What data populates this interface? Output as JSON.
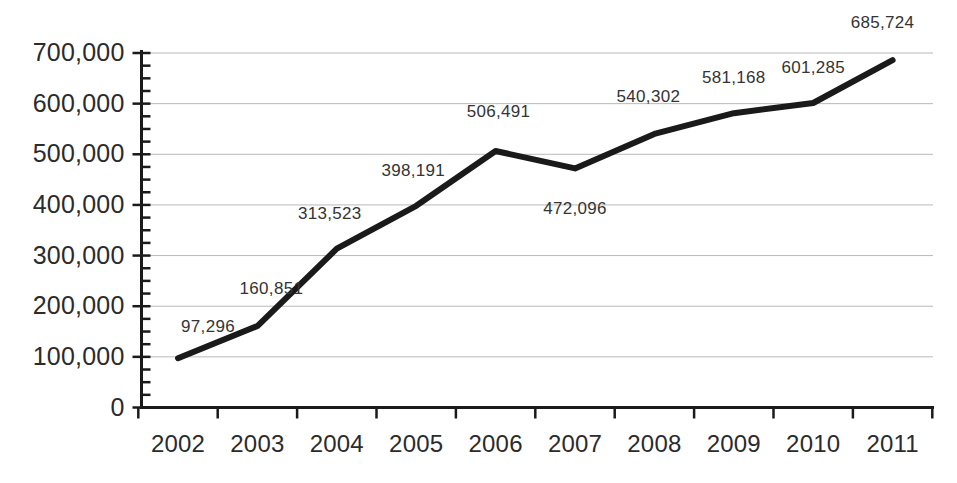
{
  "chart_data": {
    "type": "line",
    "title": "",
    "subtitle": "",
    "xlabel": "",
    "ylabel": "",
    "categories": [
      "2002",
      "2003",
      "2004",
      "2005",
      "2006",
      "2007",
      "2008",
      "2009",
      "2010",
      "2011"
    ],
    "values": [
      97296,
      160851,
      313523,
      398191,
      506491,
      472096,
      540302,
      581168,
      601285,
      685724
    ],
    "point_labels": [
      "97,296",
      "160,851",
      "313,523",
      "398,191",
      "506,491",
      "472,096",
      "540,302",
      "581,168",
      "601,285",
      "685,724"
    ],
    "ylim": [
      0,
      700000
    ],
    "ytick_labels": [
      "700,000",
      "600,000",
      "500,000",
      "400,000",
      "300,000",
      "200,000",
      "100,000",
      "0"
    ],
    "ytick_values": [
      700000,
      600000,
      500000,
      400000,
      300000,
      200000,
      100000,
      0
    ],
    "minor_tick_step": 25000,
    "grid": true,
    "grid_axis": "y",
    "legend": false,
    "legend_position": "none",
    "series_color": "#1a1a1a",
    "grid_color": "#b9b9b9",
    "axis_color": "#1a1a1a",
    "label_color": "#2b2b2b",
    "line_width": 6
  }
}
